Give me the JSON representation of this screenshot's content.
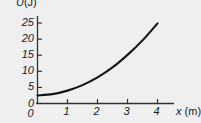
{
  "chart_data": {
    "type": "line",
    "title": "",
    "subtitle": "",
    "xlabel": "x (m)",
    "ylabel": "U (J)",
    "xlabel_symbol": "x",
    "xlabel_unit": "(m)",
    "ylabel_symbol": "U",
    "ylabel_unit": "(J)",
    "x": [
      0,
      0.5,
      1,
      1.5,
      2,
      2.5,
      3,
      3.5,
      4
    ],
    "values": [
      2.5,
      2.9,
      4.0,
      5.7,
      8.1,
      11.2,
      15.1,
      19.6,
      24.9
    ],
    "series": [
      {
        "name": "U(x)",
        "values": [
          2.5,
          2.9,
          4.0,
          5.7,
          8.1,
          11.2,
          15.1,
          19.6,
          24.9
        ]
      }
    ],
    "xticks": [
      0,
      1,
      2,
      3,
      4
    ],
    "xtick_labels": [
      "0",
      "1",
      "2",
      "3",
      "4"
    ],
    "yticks": [
      0,
      5,
      10,
      15,
      20,
      25
    ],
    "ytick_labels": [
      "0",
      "5",
      "10",
      "15",
      "20",
      "25"
    ],
    "xlim": [
      0,
      4.45
    ],
    "ylim": [
      0,
      27
    ],
    "grid": false,
    "legend": false,
    "legend_position": "none",
    "curve_color": "#141414",
    "axis_color": "#333333",
    "background_color": "#efefef",
    "annotations": []
  },
  "axes": {
    "y_origin_label": "0",
    "x_origin_label": "0"
  }
}
